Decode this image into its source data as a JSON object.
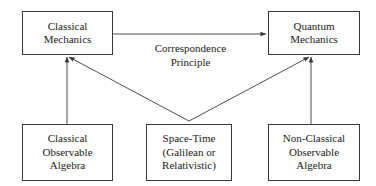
{
  "diagram": {
    "background_color": "#ffffff",
    "line_color": "#3a3a3a",
    "text_color": "#1b1b1b",
    "nodes": [
      {
        "id": "classical-mechanics",
        "label": "Classical\nMechanics"
      },
      {
        "id": "quantum-mechanics",
        "label": "Quantum\nMechanics"
      },
      {
        "id": "classical-observable-algebra",
        "label": "Classical\nObservable\nAlgebra"
      },
      {
        "id": "space-time",
        "label": "Space-Time\n(Galilean or\nRelativistic)"
      },
      {
        "id": "non-classical-observable-algebra",
        "label": "Non-Classical\nObservable\nAlgebra"
      }
    ],
    "edges": [
      {
        "id": "classical-to-quantum",
        "label": "Correspondence\nPrinciple",
        "from": "classical-mechanics",
        "to": "quantum-mechanics"
      },
      {
        "id": "classical-algebra-to-classical-mechanics",
        "label": "",
        "from": "classical-observable-algebra",
        "to": "classical-mechanics"
      },
      {
        "id": "non-classical-algebra-to-quantum-mechanics",
        "label": "",
        "from": "non-classical-observable-algebra",
        "to": "quantum-mechanics"
      },
      {
        "id": "space-time-to-classical-mechanics",
        "label": "",
        "from": "space-time",
        "to": "classical-mechanics"
      },
      {
        "id": "space-time-to-quantum-mechanics",
        "label": "",
        "from": "space-time",
        "to": "quantum-mechanics"
      }
    ]
  }
}
